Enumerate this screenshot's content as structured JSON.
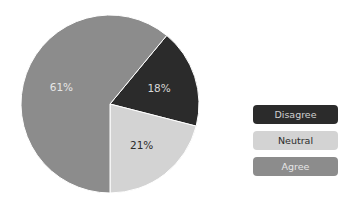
{
  "chart_data": {
    "type": "pie",
    "title": "",
    "categories": [
      "Disagree",
      "Neutral",
      "Agree"
    ],
    "values": [
      18,
      21,
      61
    ],
    "labels": [
      "18%",
      "21%",
      "61%"
    ],
    "colors": [
      "#2b2b2b",
      "#d3d3d3",
      "#8c8c8c"
    ],
    "label_colors": [
      "#d8d8d8",
      "#2b2b2b",
      "#e6e6e6"
    ],
    "start_angle_deg": 0,
    "legend_position": "right"
  },
  "legend": {
    "items": [
      {
        "label": "Disagree",
        "color": "#2b2b2b",
        "text_color": "#d0d0d0"
      },
      {
        "label": "Neutral",
        "color": "#d3d3d3",
        "text_color": "#2b2b2b"
      },
      {
        "label": "Agree",
        "color": "#8c8c8c",
        "text_color": "#e6e6e6"
      }
    ]
  }
}
